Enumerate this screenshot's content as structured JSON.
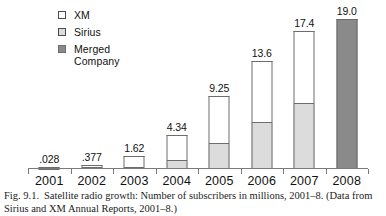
{
  "figure": {
    "caption_label": "Fig. 9.1.",
    "caption_text": "Satellite radio growth: Number of subscribers in millions, 2001–8. (Data from Sirius and XM Annual Reports, 2001–8.)"
  },
  "legend": {
    "position": "top-left",
    "items": [
      {
        "label": "XM",
        "color": "#ffffff",
        "swatch": "legend-swatch-xm"
      },
      {
        "label": "Sirius",
        "color": "#dcdcdc",
        "swatch": "legend-swatch-sirius"
      },
      {
        "label": "Merged",
        "label2": "Company",
        "color": "#8a8a8a",
        "swatch": "legend-swatch-merged"
      }
    ]
  },
  "chart_data": {
    "type": "bar",
    "stacked": true,
    "title": "Satellite radio growth: Number of subscribers in millions, 2001–8.",
    "xlabel": "",
    "ylabel": "",
    "ylim": [
      0,
      19.6
    ],
    "grid": false,
    "legend_position": "top-left",
    "categories": [
      "2001",
      "2002",
      "2003",
      "2004",
      "2005",
      "2006",
      "2007",
      "2008"
    ],
    "totals": [
      0.028,
      0.377,
      1.62,
      4.34,
      9.25,
      13.6,
      17.4,
      19.0
    ],
    "total_labels": [
      ".028",
      ".377",
      "1.62",
      "4.34",
      "9.25",
      "13.6",
      "17.4",
      "19.0"
    ],
    "series": [
      {
        "name": "Sirius",
        "color": "#dcdcdc",
        "values": [
          0.02,
          0.3,
          0.26,
          1.14,
          3.3,
          6.0,
          8.3,
          0
        ]
      },
      {
        "name": "XM",
        "color": "#ffffff",
        "values": [
          0.008,
          0.077,
          1.36,
          3.2,
          5.95,
          7.6,
          9.1,
          0
        ]
      },
      {
        "name": "Merged Company",
        "color": "#8a8a8a",
        "values": [
          0,
          0,
          0,
          0,
          0,
          0,
          0,
          19.0
        ]
      }
    ]
  },
  "colors": {
    "xm": "#ffffff",
    "sirius": "#dcdcdc",
    "merged": "#8a8a8a",
    "outline": "#6d6d6d",
    "axis": "#7a7a7a"
  }
}
